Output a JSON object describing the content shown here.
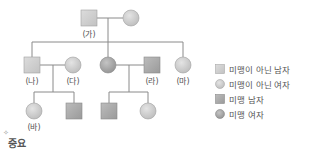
{
  "colors": {
    "line": "#8a8a8a",
    "unaffected_fill": "#d2d2d2",
    "affected_fill": "#a9a9a9",
    "stroke": "#9a9a9a"
  },
  "individuals": [
    {
      "id": "ga_male",
      "sex": "male",
      "affected": false,
      "label": "(가)",
      "x": 89,
      "y": 18
    },
    {
      "id": "ga_female",
      "sex": "female",
      "affected": false,
      "label": "",
      "x": 131,
      "y": 18
    },
    {
      "id": "na",
      "sex": "male",
      "affected": false,
      "label": "(나)",
      "x": 32,
      "y": 65
    },
    {
      "id": "da",
      "sex": "female",
      "affected": false,
      "label": "(다)",
      "x": 73,
      "y": 65
    },
    {
      "id": "mid_female",
      "sex": "female",
      "affected": true,
      "label": "",
      "x": 108,
      "y": 65
    },
    {
      "id": "ra",
      "sex": "male",
      "affected": true,
      "label": "(라)",
      "x": 152,
      "y": 65
    },
    {
      "id": "ma",
      "sex": "female",
      "affected": false,
      "label": "(마)",
      "x": 183,
      "y": 65
    },
    {
      "id": "ba",
      "sex": "female",
      "affected": false,
      "label": "(바)",
      "x": 34,
      "y": 111
    },
    {
      "id": "na_son",
      "sex": "male",
      "affected": true,
      "label": "",
      "x": 74,
      "y": 111
    },
    {
      "id": "mid_son",
      "sex": "male",
      "affected": true,
      "label": "",
      "x": 109,
      "y": 111
    },
    {
      "id": "mid_daughter",
      "sex": "female",
      "affected": false,
      "label": "",
      "x": 148,
      "y": 111
    }
  ],
  "labels": {
    "ga": "(가)",
    "na": "(나)",
    "da": "(다)",
    "ra": "(라)",
    "ma": "(마)",
    "ba": "(바)"
  },
  "legend": {
    "items": [
      {
        "label": "미맹이 아닌 남자",
        "shape": "square",
        "affected": false
      },
      {
        "label": "미맹이 아닌 여자",
        "shape": "circle",
        "affected": false
      },
      {
        "label": "미맹 남자",
        "shape": "square",
        "affected": true
      },
      {
        "label": "미맹 여자",
        "shape": "circle",
        "affected": true
      }
    ]
  },
  "footer": {
    "text": "중요",
    "star": "✧"
  }
}
